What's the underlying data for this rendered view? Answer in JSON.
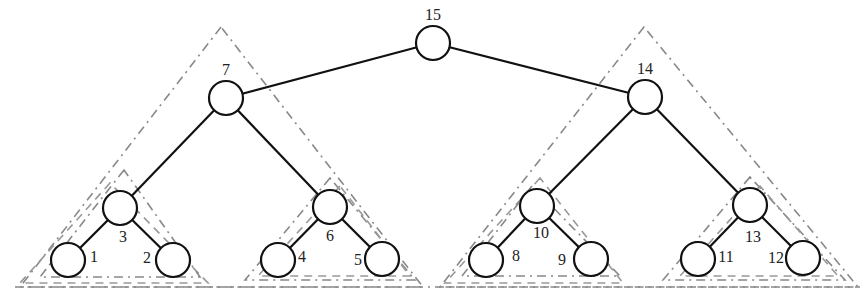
{
  "diagram": {
    "type": "binary-tree",
    "numbering": "postorder",
    "nodes": [
      {
        "id": "15",
        "label": "15",
        "x": 433,
        "y": 43,
        "lx": 433,
        "ly": 15
      },
      {
        "id": "7",
        "label": "7",
        "x": 226,
        "y": 98,
        "lx": 226,
        "ly": 70
      },
      {
        "id": "14",
        "label": "14",
        "x": 645,
        "y": 97,
        "lx": 645,
        "ly": 69
      },
      {
        "id": "3",
        "label": "3",
        "x": 120,
        "y": 208,
        "lx": 123,
        "ly": 237
      },
      {
        "id": "6",
        "label": "6",
        "x": 330,
        "y": 207,
        "lx": 330,
        "ly": 236
      },
      {
        "id": "10",
        "label": "10",
        "x": 537,
        "y": 206,
        "lx": 541,
        "ly": 233
      },
      {
        "id": "13",
        "label": "13",
        "x": 750,
        "y": 205,
        "lx": 753,
        "ly": 237
      },
      {
        "id": "1",
        "label": "1",
        "x": 68,
        "y": 260,
        "lx": 94,
        "ly": 257
      },
      {
        "id": "2",
        "label": "2",
        "x": 173,
        "y": 260,
        "lx": 147,
        "ly": 258
      },
      {
        "id": "4",
        "label": "4",
        "x": 278,
        "y": 260,
        "lx": 302,
        "ly": 257
      },
      {
        "id": "5",
        "label": "5",
        "x": 382,
        "y": 259,
        "lx": 358,
        "ly": 260
      },
      {
        "id": "8",
        "label": "8",
        "x": 486,
        "y": 260,
        "lx": 516,
        "ly": 256
      },
      {
        "id": "9",
        "label": "9",
        "x": 591,
        "y": 259,
        "lx": 562,
        "ly": 260
      },
      {
        "id": "11",
        "label": "11",
        "x": 698,
        "y": 259,
        "lx": 726,
        "ly": 257
      },
      {
        "id": "12",
        "label": "12",
        "x": 803,
        "y": 258,
        "lx": 776,
        "ly": 258
      }
    ],
    "edges": [
      [
        "15",
        "7"
      ],
      [
        "15",
        "14"
      ],
      [
        "7",
        "3"
      ],
      [
        "7",
        "6"
      ],
      [
        "14",
        "10"
      ],
      [
        "14",
        "13"
      ],
      [
        "3",
        "1"
      ],
      [
        "3",
        "2"
      ],
      [
        "6",
        "4"
      ],
      [
        "6",
        "5"
      ],
      [
        "10",
        "8"
      ],
      [
        "10",
        "9"
      ],
      [
        "13",
        "11"
      ],
      [
        "13",
        "12"
      ]
    ],
    "node_radius": 17,
    "subtree_triangles": [
      {
        "name": "subtree-7",
        "points": [
          [
            221,
            27
          ],
          [
            20,
            287
          ],
          [
            423,
            287
          ]
        ],
        "style": "dash-dot"
      },
      {
        "name": "subtree-14",
        "points": [
          [
            644,
            27
          ],
          [
            440,
            287
          ],
          [
            858,
            287
          ]
        ],
        "style": "dash-dot"
      },
      {
        "name": "subtree-3",
        "points": [
          [
            110,
            183
          ],
          [
            20,
            283
          ],
          [
            208,
            283
          ]
        ],
        "style": "dash"
      },
      {
        "name": "subtree-3-outer",
        "points": [
          [
            124,
            170
          ],
          [
            40,
            277
          ],
          [
            200,
            277
          ]
        ],
        "style": "dash-dot"
      },
      {
        "name": "subtree-6",
        "points": [
          [
            330,
            178
          ],
          [
            245,
            280
          ],
          [
            415,
            280
          ]
        ],
        "style": "dash-dot"
      },
      {
        "name": "subtree-6-inner",
        "points": [
          [
            340,
            186
          ],
          [
            258,
            276
          ],
          [
            410,
            276
          ]
        ],
        "style": "dash"
      },
      {
        "name": "subtree-10",
        "points": [
          [
            540,
            178
          ],
          [
            445,
            283
          ],
          [
            623,
            283
          ]
        ],
        "style": "dash"
      },
      {
        "name": "subtree-10-inner",
        "points": [
          [
            532,
            186
          ],
          [
            462,
            276
          ],
          [
            620,
            276
          ]
        ],
        "style": "dash-dot"
      },
      {
        "name": "subtree-13",
        "points": [
          [
            750,
            177
          ],
          [
            663,
            280
          ],
          [
            845,
            280
          ]
        ],
        "style": "dash-dot"
      },
      {
        "name": "subtree-13-inner",
        "points": [
          [
            760,
            186
          ],
          [
            680,
            276
          ],
          [
            838,
            276
          ]
        ],
        "style": "dash"
      }
    ],
    "baseline": {
      "x1": 15,
      "x2": 860,
      "y": 287,
      "style": "dash-dot"
    }
  }
}
